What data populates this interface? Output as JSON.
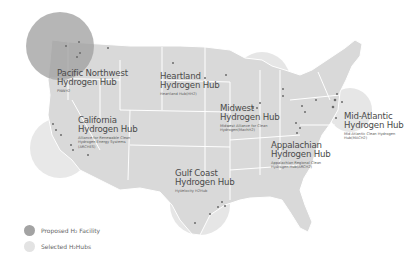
{
  "colors": {
    "background": "#ffffff",
    "state_fill": "#d9d9d9",
    "state_border": "#ffffff",
    "hub_circle": "#c4c4c4",
    "hub_circle_light": "#e6e6e6",
    "pnw_circle": "#9e9e9e",
    "facility_dot": "#6b6b6b",
    "text": "#4a4a4a"
  },
  "hubs": [
    {
      "id": "pnw",
      "title_line1": "Pacific Northwest",
      "title_line2": "Hydrogen Hub",
      "subtitle": "PNWH2"
    },
    {
      "id": "heartland",
      "title_line1": "Heartland",
      "title_line2": "Hydrogen Hub",
      "subtitle": "Heartland Hub(HH2)"
    },
    {
      "id": "california",
      "title_line1": "California",
      "title_line2": "Hydrogen Hub",
      "subtitle": "Alliance for Renewable Clean Hydrogen Energy Systems (ARCHES)"
    },
    {
      "id": "midwest",
      "title_line1": "Midwest",
      "title_line2": "Hydrogen Hub",
      "subtitle": "Midwest Alliance for Clean Hydrogen(MachH2)"
    },
    {
      "id": "midatlantic",
      "title_line1": "Mid-Atlantic",
      "title_line2": "Hydrogen Hub",
      "subtitle": "Mid-Atlantic Clean Hydrogen Hub(MACH2)"
    },
    {
      "id": "appalachian",
      "title_line1": "Appalachian",
      "title_line2": "Hydrogen Hub",
      "subtitle": "Appalachian Regional Clean Hydrogen Hub(ARCH2)"
    },
    {
      "id": "gulfcoast",
      "title_line1": "Gulf Coast",
      "title_line2": "Hydrogen Hub",
      "subtitle": "HyVelocity H2Hub"
    }
  ],
  "legend": {
    "proposed_facility": "Proposed H₂ Facility",
    "selected_hubs": "Selected H₂Hubs"
  }
}
